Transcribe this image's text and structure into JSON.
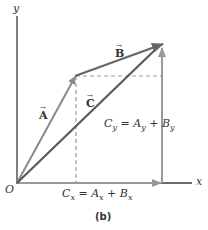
{
  "figure": {
    "caption": "(b)",
    "axes": {
      "x_label": "x",
      "y_label": "y",
      "origin_label": "O"
    },
    "vectors": {
      "A": {
        "label": "A",
        "arrow": "→"
      },
      "B": {
        "label": "B",
        "arrow": "→"
      },
      "C": {
        "label": "C",
        "arrow": "→"
      }
    },
    "equations": {
      "cx": {
        "lhs": "C",
        "lhs_sub": "x",
        "eq": " = ",
        "a": "A",
        "a_sub": "x",
        "plus": " + ",
        "b": "B",
        "b_sub": "x"
      },
      "cy": {
        "lhs": "C",
        "lhs_sub": "y",
        "eq": " = ",
        "a": "A",
        "a_sub": "y",
        "plus": " + ",
        "b": "B",
        "b_sub": "y"
      }
    },
    "colors": {
      "axis": "#3a3a3a",
      "vector_a": "#8a8a8a",
      "vector_b": "#6a6a6a",
      "vector_c": "#5a5a5a",
      "component": "#9a9a9a",
      "dashed": "#999999"
    }
  }
}
